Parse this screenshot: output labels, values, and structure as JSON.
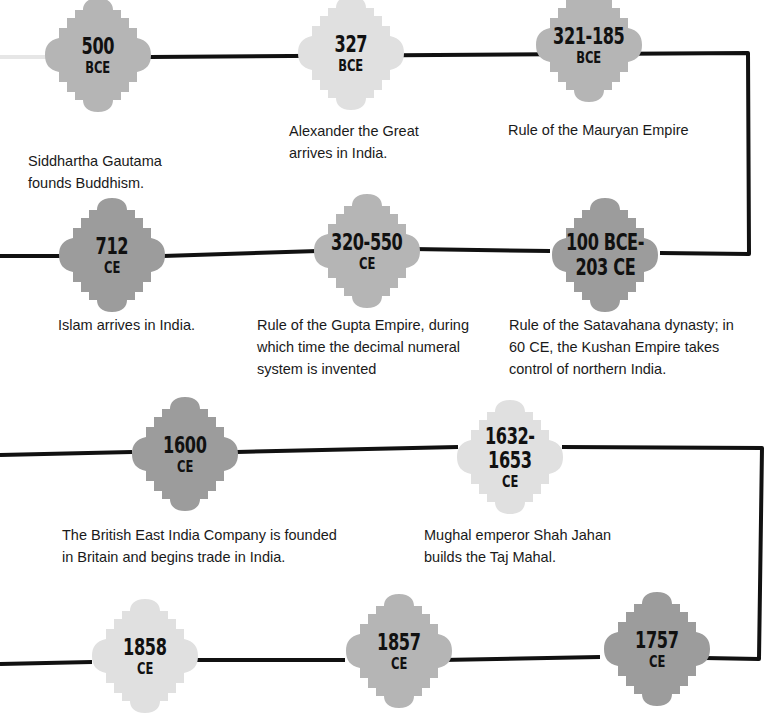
{
  "colors": {
    "light": "#e0e0e0",
    "medium": "#b5b5b5",
    "dark": "#9c9c9c",
    "line": "#111111",
    "fade_line": "#e6e6e6"
  },
  "events": [
    {
      "id": "e500",
      "date_line1": "500",
      "date_line2": "BCE",
      "description": "Siddhartha Gautama founds Buddhism.",
      "shade": "medium"
    },
    {
      "id": "e327",
      "date_line1": "327",
      "date_line2": "BCE",
      "description": "Alexander the Great arrives in India.",
      "shade": "light"
    },
    {
      "id": "e321",
      "date_line1": "321-185",
      "date_line2": "BCE",
      "description": "Rule of the Mauryan Empire",
      "shade": "medium"
    },
    {
      "id": "e100",
      "date_line1": "100 BCE-",
      "date_line2": "203 CE",
      "description": "Rule of the Satavahana dynasty; in 60 CE, the Kushan Empire takes control of northern India.",
      "shade": "dark"
    },
    {
      "id": "e320",
      "date_line1": "320-550",
      "date_line2": "CE",
      "description": "Rule of the Gupta Empire, during which time the decimal numeral system is invented",
      "shade": "medium"
    },
    {
      "id": "e712",
      "date_line1": "712",
      "date_line2": "CE",
      "description": "Islam arrives in India.",
      "shade": "dark"
    },
    {
      "id": "e1600",
      "date_line1": "1600",
      "date_line2": "CE",
      "description": "The British East India Company is founded in Britain and begins trade in India.",
      "shade": "dark"
    },
    {
      "id": "e1632",
      "date_line1": "1632-",
      "date_line2": "1653",
      "date_line3": "CE",
      "description": "Mughal emperor Shah Jahan builds the Taj Mahal.",
      "shade": "light"
    },
    {
      "id": "e1757",
      "date_line1": "1757",
      "date_line2": "CE",
      "shade": "dark"
    },
    {
      "id": "e1857",
      "date_line1": "1857",
      "date_line2": "CE",
      "shade": "medium"
    },
    {
      "id": "e1858",
      "date_line1": "1858",
      "date_line2": "CE",
      "shade": "light"
    }
  ],
  "desc_lines": {
    "e500": [
      "Siddhartha Gautama",
      "founds Buddhism."
    ],
    "e327": [
      "Alexander the Great",
      "arrives in India."
    ],
    "e321": [
      "Rule of the Mauryan Empire"
    ],
    "e712": [
      "Islam arrives in India."
    ],
    "e320": [
      "Rule of the Gupta Empire, during",
      "which time the decimal numeral",
      "system is invented"
    ],
    "e100": [
      "Rule of the Satavahana dynasty; in",
      "60 CE, the Kushan Empire takes",
      "control of northern India."
    ],
    "e1600": [
      "The British East India Company is founded",
      "in Britain and begins trade in India."
    ],
    "e1632": [
      "Mughal emperor Shah Jahan",
      "builds the Taj Mahal."
    ]
  }
}
